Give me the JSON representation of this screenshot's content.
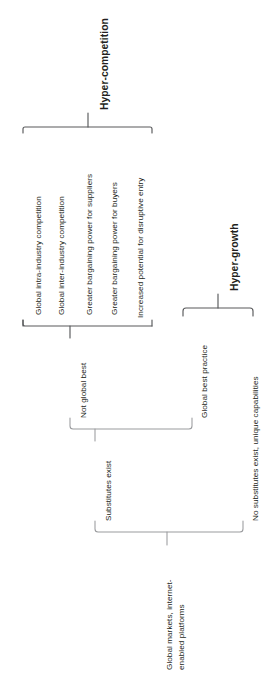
{
  "diagram": {
    "orientation": "rotated-90-ccw",
    "line_color": "#58595b",
    "text_color": "#231f20",
    "root": {
      "label": "Global markets, internet-enabled platforms"
    },
    "branches": {
      "substitutes_exist": "Substitutes exist",
      "no_substitutes": "No substitutes exist, unique capabilities",
      "not_global_best": "Not global best",
      "global_best_practice": "Global best practice"
    },
    "outcomes": {
      "hyper_competition": "Hyper-competition",
      "hyper_growth": "Hyper-growth"
    },
    "hyper_competition_items": [
      "Global intra-industry competition",
      "Global inter-industry competition",
      "Greater bargaining power for suppliers",
      "Greater bargaining power for buyers",
      "Increased potential for disruptive entry"
    ],
    "root_line1": "Global markets, internet-",
    "root_line2": "enabled platforms"
  }
}
